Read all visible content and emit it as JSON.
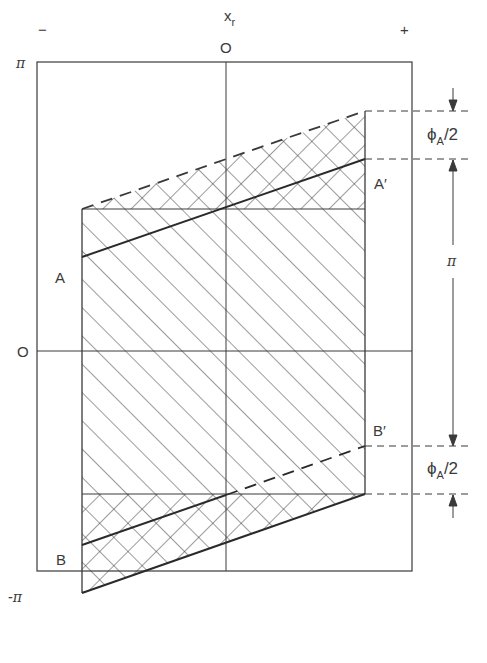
{
  "figure": {
    "axis": {
      "x_label": "x",
      "x_label_sub": "r",
      "x_minus": "−",
      "x_plus": "+",
      "x_zero": "O",
      "y_top": "π",
      "y_zero": "O",
      "y_bottom": "-π"
    },
    "regions": {
      "A": "A",
      "A_prime": "A′",
      "B": "B",
      "B_prime": "B′"
    },
    "dimensions": {
      "top_phi": "ϕ",
      "top_phi_sub": "A",
      "top_phi_tail": "/2",
      "middle": "π",
      "bottom_phi": "ϕ",
      "bottom_phi_sub": "A",
      "bottom_phi_tail": "/2"
    },
    "colors": {
      "line": "#3a3a3a",
      "background": "#ffffff"
    }
  }
}
